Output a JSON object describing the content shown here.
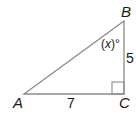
{
  "diagram": {
    "type": "right-triangle",
    "vertices": {
      "A": {
        "label": "A",
        "x": 24,
        "y": 94
      },
      "B": {
        "label": "B",
        "x": 124,
        "y": 21
      },
      "C": {
        "label": "C",
        "x": 124,
        "y": 94
      }
    },
    "sides": {
      "AC": {
        "label": "7"
      },
      "BC": {
        "label": "5"
      }
    },
    "angle_B": {
      "label_open": "(",
      "label_var": "x",
      "label_close": ")°"
    },
    "right_angle_at": "C",
    "colors": {
      "line": "#8a8a8a",
      "text": "#1a1a1a",
      "background": "#ffffff"
    }
  }
}
